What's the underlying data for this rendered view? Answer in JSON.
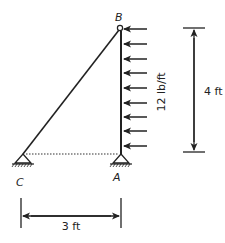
{
  "diagram": {
    "type": "truss-structure",
    "nodes": {
      "B": {
        "label": "B",
        "x": 120,
        "y": 28
      },
      "A": {
        "label": "A",
        "x": 121,
        "y": 154
      },
      "C": {
        "label": "C",
        "x": 23,
        "y": 154
      }
    },
    "members": [
      {
        "from": "C",
        "to": "B",
        "style": "solid"
      },
      {
        "from": "A",
        "to": "B",
        "style": "solid"
      },
      {
        "from": "C",
        "to": "A",
        "style": "dotted"
      }
    ],
    "supports": [
      {
        "node": "A",
        "type": "pin"
      },
      {
        "node": "C",
        "type": "pin"
      }
    ],
    "load": {
      "type": "distributed",
      "label": "12 lb/ft",
      "direction": "left",
      "arrow_count": 9
    },
    "dimensions": {
      "vertical": {
        "label": "4 ft"
      },
      "horizontal": {
        "label": "3 ft"
      }
    },
    "colors": {
      "line": "#222222",
      "background": "#ffffff"
    }
  }
}
